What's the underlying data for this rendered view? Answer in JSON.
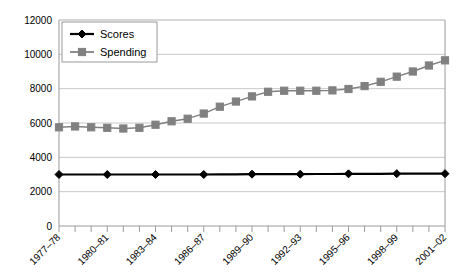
{
  "chart_data": {
    "type": "line",
    "title": "",
    "subtitle": "",
    "xlabel": "",
    "ylabel": "",
    "ylim": [
      0,
      12000
    ],
    "y_ticks": [
      0,
      2000,
      4000,
      6000,
      8000,
      10000,
      12000
    ],
    "y_tick_labels": [
      "0",
      "2000",
      "4000",
      "6000",
      "8000",
      "10000",
      "12000"
    ],
    "grid": true,
    "grid_axis": "y",
    "legend_position": "top-left",
    "x": [
      "1977-78",
      "1978-79",
      "1979-80",
      "1980-81",
      "1981-82",
      "1982-83",
      "1983-84",
      "1984-85",
      "1985-86",
      "1986-87",
      "1987-88",
      "1988-89",
      "1989-90",
      "1990-91",
      "1991-92",
      "1992-93",
      "1993-94",
      "1994-95",
      "1995-96",
      "1996-97",
      "1997-98",
      "1998-99",
      "1999-00",
      "2000-01",
      "2001-02"
    ],
    "x_tick_labels_shown": [
      "1977–78",
      "1980–81",
      "1983–84",
      "1986–87",
      "1989–90",
      "1992–93",
      "1995–96",
      "1998–99",
      "2001–02"
    ],
    "x_label_interval": 3,
    "series": [
      {
        "name": "Scores",
        "color": "#000000",
        "marker": "diamond",
        "marker_interval": 3,
        "values": [
          3000,
          3000,
          3000,
          3000,
          3000,
          3000,
          3000,
          3000,
          3000,
          3000,
          3010,
          3010,
          3020,
          3020,
          3020,
          3020,
          3030,
          3030,
          3040,
          3040,
          3040,
          3050,
          3050,
          3050,
          3050
        ]
      },
      {
        "name": "Spending",
        "color": "#808080",
        "marker": "square",
        "marker_interval": 1,
        "values": [
          5750,
          5800,
          5750,
          5720,
          5680,
          5720,
          5900,
          6100,
          6250,
          6550,
          6950,
          7250,
          7550,
          7820,
          7880,
          7880,
          7880,
          7900,
          7980,
          8150,
          8400,
          8700,
          9000,
          9350,
          9650
        ]
      }
    ]
  },
  "legend": {
    "entries": [
      {
        "label": "Scores",
        "color": "#000000",
        "marker": "diamond"
      },
      {
        "label": "Spending",
        "color": "#808080",
        "marker": "square"
      }
    ]
  },
  "colors": {
    "scores": "#000000",
    "spending": "#808080",
    "grid": "#c9c9c9",
    "axis": "#9a9a9a",
    "plot_border": "#9a9a9a",
    "background": "#ffffff",
    "text": "#000000"
  }
}
